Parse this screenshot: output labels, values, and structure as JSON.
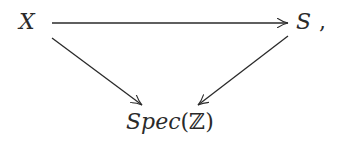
{
  "diagram": {
    "type": "commutative-triangle",
    "nodes": {
      "x": {
        "label": "X"
      },
      "s": {
        "label": "S",
        "trailing": ","
      },
      "spec": {
        "prefix": "Spec",
        "open": "(",
        "ring": "ℤ",
        "close": ")"
      }
    },
    "arrows": [
      {
        "from": "X",
        "to": "S"
      },
      {
        "from": "X",
        "to": "Spec(ℤ)"
      },
      {
        "from": "S",
        "to": "Spec(ℤ)"
      }
    ],
    "colors": {
      "ink": "#2a2a2a",
      "background": "#ffffff"
    }
  }
}
